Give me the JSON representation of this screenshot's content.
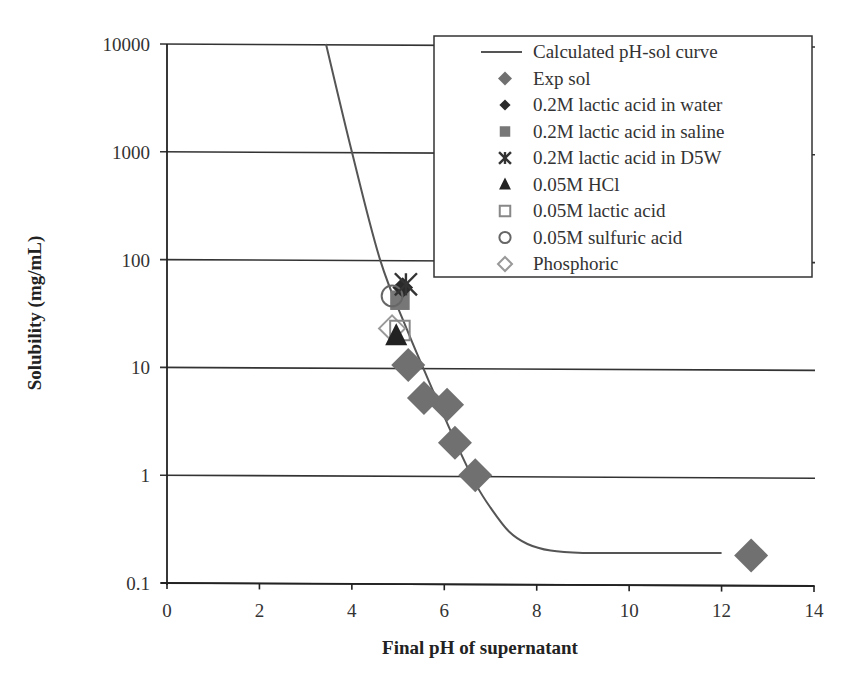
{
  "chart_data": {
    "type": "scatter",
    "title": "",
    "xlabel": "Final pH of supernatant",
    "ylabel": "Solubility (mg/mL)",
    "xlim": [
      0,
      14
    ],
    "ylim": [
      0.1,
      10000
    ],
    "yscale": "log",
    "x_ticks": [
      "0",
      "2",
      "4",
      "6",
      "8",
      "10",
      "12",
      "14"
    ],
    "y_ticks": [
      "0.1",
      "1",
      "10",
      "100",
      "1000",
      "10000"
    ],
    "grid": "horizontal major gridlines",
    "legend_position": "upper right",
    "series": [
      {
        "name": "Calculated pH-sol curve",
        "kind": "line",
        "color": "#555555",
        "x": [
          3.44,
          4.0,
          4.61,
          5.2,
          5.8,
          6.3,
          6.7,
          7.0,
          7.4,
          7.8,
          8.3,
          9.0,
          10.0,
          11.0,
          12.0
        ],
        "y": [
          10000,
          1000,
          100,
          22,
          5.5,
          1.8,
          0.8,
          0.5,
          0.3,
          0.23,
          0.2,
          0.19,
          0.19,
          0.19,
          0.19
        ]
      },
      {
        "name": "Exp sol",
        "kind": "marker",
        "marker": "filled-diamond",
        "color": "#707070",
        "x": [
          5.22,
          5.56,
          6.06,
          6.23,
          6.67,
          12.64
        ],
        "y": [
          10.5,
          5.2,
          4.5,
          2.0,
          1.0,
          0.18
        ]
      },
      {
        "name": "0.2M lactic acid in water",
        "kind": "marker",
        "marker": "filled-diamond-small",
        "color": "#2a2a2a",
        "x": [
          5.1
        ],
        "y": [
          55
        ]
      },
      {
        "name": "0.2M lactic acid in saline",
        "kind": "marker",
        "marker": "filled-square",
        "color": "#777777",
        "x": [
          5.04
        ],
        "y": [
          42
        ]
      },
      {
        "name": "0.2M lactic acid in D5W",
        "kind": "marker",
        "marker": "asterisk",
        "color": "#333333",
        "x": [
          5.17
        ],
        "y": [
          59
        ]
      },
      {
        "name": "0.05M HCl",
        "kind": "marker",
        "marker": "filled-triangle",
        "color": "#222222",
        "x": [
          4.96
        ],
        "y": [
          19.5
        ]
      },
      {
        "name": "0.05M lactic acid",
        "kind": "marker",
        "marker": "open-square",
        "color": "#888888",
        "x": [
          5.04
        ],
        "y": [
          22
        ]
      },
      {
        "name": "0.05M sulfuric acid",
        "kind": "marker",
        "marker": "open-circle",
        "color": "#666666",
        "x": [
          4.87
        ],
        "y": [
          46
        ]
      },
      {
        "name": "Phosphoric",
        "kind": "marker",
        "marker": "open-diamond",
        "color": "#999999",
        "x": [
          4.87
        ],
        "y": [
          23
        ]
      }
    ]
  }
}
